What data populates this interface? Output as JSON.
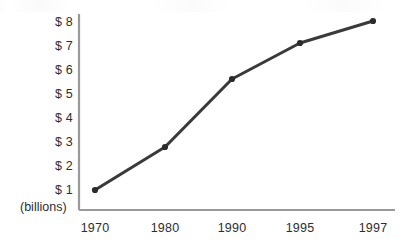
{
  "chart_data": {
    "type": "line",
    "title": "",
    "subtitle": "",
    "xlabel": "",
    "ylabel": "",
    "units_note": "(billions)",
    "categories": [
      "1970",
      "1980",
      "1990",
      "1995",
      "1997"
    ],
    "x": [
      1970,
      1980,
      1990,
      1995,
      1997
    ],
    "values": [
      1.0,
      2.8,
      5.6,
      7.3,
      8.1
    ],
    "series": [
      {
        "name": "",
        "values": [
          1.0,
          2.8,
          5.6,
          7.3,
          8.1
        ]
      }
    ],
    "ytick_labels": [
      "$ 8",
      "$ 7",
      "$ 6",
      "$ 5",
      "$ 4",
      "$ 3",
      "$ 2",
      "$ 1"
    ],
    "ytick_values": [
      8,
      7,
      6,
      5,
      4,
      3,
      2,
      1
    ],
    "xtick_labels": [
      "1970",
      "1980",
      "1990",
      "1995",
      "1997"
    ],
    "ylim": [
      0,
      8.6
    ],
    "xlim_note": "categorical, evenly-but-unequally spaced tick positions",
    "grid": false,
    "legend": "none",
    "markers": "filled round dots",
    "colors": {
      "line": "#3a3a3a",
      "marker": "#2b2b2b",
      "axis": "#9a9a9a",
      "text": "#2e2e2e",
      "background": "#ffffff"
    }
  },
  "axes": {
    "y_ticks": [
      {
        "label": "$ 8",
        "value": 8,
        "y": 22
      },
      {
        "label": "$ 7",
        "value": 7,
        "y": 46
      },
      {
        "label": "$ 6",
        "value": 6,
        "y": 70
      },
      {
        "label": "$ 5",
        "value": 5,
        "y": 94
      },
      {
        "label": "$ 4",
        "value": 4,
        "y": 118
      },
      {
        "label": "$ 3",
        "value": 3,
        "y": 142
      },
      {
        "label": "$ 2",
        "value": 2,
        "y": 166
      },
      {
        "label": "$ 1",
        "value": 1,
        "y": 190
      }
    ],
    "x_ticks": [
      {
        "label": "1970",
        "x": 95
      },
      {
        "label": "1980",
        "x": 165
      },
      {
        "label": "1990",
        "x": 232
      },
      {
        "label": "1995",
        "x": 300
      },
      {
        "label": "1997",
        "x": 373
      }
    ],
    "units_note": "(billions)"
  },
  "points": [
    {
      "label": "1970",
      "value": "1.0",
      "cx": 95,
      "cy": 190
    },
    {
      "label": "1980",
      "value": "2.8",
      "cx": 165,
      "cy": 147
    },
    {
      "label": "1990",
      "value": "5.6",
      "cx": 232,
      "cy": 79
    },
    {
      "label": "1995",
      "value": "7.3",
      "cx": 300,
      "cy": 43
    },
    {
      "label": "1997",
      "value": "8.1",
      "cx": 373,
      "cy": 21
    }
  ]
}
